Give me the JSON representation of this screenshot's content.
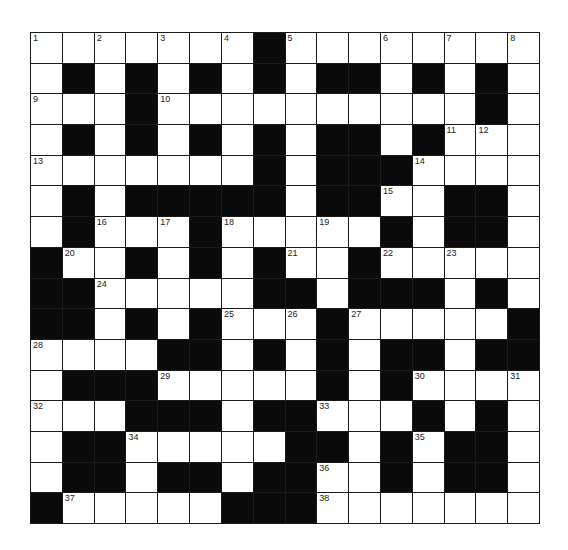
{
  "puzzle": {
    "rows": 16,
    "cols": 16,
    "grid": [
      ".......#........",
      ".#.#.#.#.##.#.#.",
      "...#..........#.",
      ".#.#.#.#.##.#...",
      ".......#.###....",
      ".#.#####.##..##.",
      ".#...#.....#.##.",
      "#..#.#.#..#.....",
      "##.....##.###.#.",
      "##.#.#...#.....#",
      "....##.#.#.##.##",
      ".###.....#.#....",
      "...###.##...#.#.",
      ".##.....##.#.##.",
      ".##.##.##..#.##.",
      "#.....###......."
    ],
    "numbers": [
      {
        "n": "1",
        "r": 0,
        "c": 0
      },
      {
        "n": "2",
        "r": 0,
        "c": 2
      },
      {
        "n": "3",
        "r": 0,
        "c": 4
      },
      {
        "n": "4",
        "r": 0,
        "c": 6
      },
      {
        "n": "5",
        "r": 0,
        "c": 8
      },
      {
        "n": "6",
        "r": 0,
        "c": 11
      },
      {
        "n": "7",
        "r": 0,
        "c": 13
      },
      {
        "n": "8",
        "r": 0,
        "c": 15
      },
      {
        "n": "9",
        "r": 2,
        "c": 0
      },
      {
        "n": "10",
        "r": 2,
        "c": 4
      },
      {
        "n": "11",
        "r": 3,
        "c": 13
      },
      {
        "n": "12",
        "r": 3,
        "c": 14
      },
      {
        "n": "13",
        "r": 4,
        "c": 0
      },
      {
        "n": "14",
        "r": 4,
        "c": 12
      },
      {
        "n": "15",
        "r": 5,
        "c": 11
      },
      {
        "n": "16",
        "r": 6,
        "c": 2
      },
      {
        "n": "17",
        "r": 6,
        "c": 4
      },
      {
        "n": "18",
        "r": 6,
        "c": 6
      },
      {
        "n": "19",
        "r": 6,
        "c": 9
      },
      {
        "n": "20",
        "r": 7,
        "c": 1
      },
      {
        "n": "21",
        "r": 7,
        "c": 8
      },
      {
        "n": "22",
        "r": 7,
        "c": 11
      },
      {
        "n": "23",
        "r": 7,
        "c": 13
      },
      {
        "n": "24",
        "r": 8,
        "c": 2
      },
      {
        "n": "25",
        "r": 9,
        "c": 6
      },
      {
        "n": "26",
        "r": 9,
        "c": 8
      },
      {
        "n": "27",
        "r": 9,
        "c": 10
      },
      {
        "n": "28",
        "r": 10,
        "c": 0
      },
      {
        "n": "29",
        "r": 11,
        "c": 4
      },
      {
        "n": "30",
        "r": 11,
        "c": 12
      },
      {
        "n": "31",
        "r": 11,
        "c": 15
      },
      {
        "n": "32",
        "r": 12,
        "c": 0
      },
      {
        "n": "33",
        "r": 12,
        "c": 9
      },
      {
        "n": "34",
        "r": 13,
        "c": 3
      },
      {
        "n": "35",
        "r": 13,
        "c": 12
      },
      {
        "n": "36",
        "r": 14,
        "c": 9
      },
      {
        "n": "37",
        "r": 15,
        "c": 1
      },
      {
        "n": "38",
        "r": 15,
        "c": 9
      }
    ],
    "colors": {
      "block": "#0a0a0a",
      "cell": "#ffffff",
      "line": "#1a1a1a"
    }
  }
}
